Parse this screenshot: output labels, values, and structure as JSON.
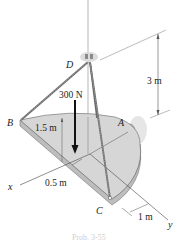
{
  "figure": {
    "points": {
      "A": "A",
      "B": "B",
      "C": "C",
      "D": "D"
    },
    "axes": {
      "x": "x",
      "y": "y"
    },
    "load": {
      "label": "300 N",
      "direction": "down"
    },
    "dimensions": {
      "height_D": "3 m",
      "radius": "1.5 m",
      "offset_x": "0.5 m",
      "offset_y": "1 m"
    },
    "caption": "Prob. 3-55",
    "colors": {
      "plate_top": "#d6d6d6",
      "plate_edge": "#bdbdbd",
      "cable": "#6b6b6b",
      "lines": "#444444",
      "support": "#c8c8c8"
    }
  }
}
